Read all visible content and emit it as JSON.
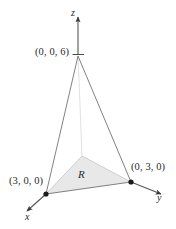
{
  "figure": {
    "kind": "3d-coordinate-sketch",
    "background_color": "#ffffff",
    "line_color": "#5a5a5a",
    "axis_color": "#3a3a3a",
    "text_color": "#2b2b2b",
    "region_fill_color": "#e8e8e8",
    "region_fill_opacity": 0.85,
    "vertex_dot_color": "#1a1a1a"
  },
  "axes": [
    {
      "id": "z",
      "label": "z",
      "direction": "up"
    },
    {
      "id": "x",
      "label": "x",
      "direction": "down-left"
    },
    {
      "id": "y",
      "label": "y",
      "direction": "down-right"
    }
  ],
  "vertices": [
    {
      "id": "apex",
      "label": "(0, 0, 6)",
      "point": [
        0,
        0,
        6
      ],
      "px": [
        78,
        55
      ],
      "dot": false
    },
    {
      "id": "xint",
      "label": "(3, 0, 0)",
      "point": [
        3,
        0,
        0
      ],
      "px": [
        46,
        194
      ],
      "dot": true
    },
    {
      "id": "yint",
      "label": "(0, 3, 0)",
      "point": [
        0,
        3,
        0
      ],
      "px": [
        131,
        182
      ],
      "dot": true
    },
    {
      "id": "origin",
      "label": "",
      "point": [
        0,
        0,
        0
      ],
      "px": [
        82,
        156
      ],
      "dot": false
    }
  ],
  "region": {
    "label": "R",
    "vertices": [
      "origin",
      "xint",
      "yint"
    ],
    "shaded": true
  },
  "edges": [
    {
      "from": "apex",
      "to": "xint",
      "style": "solid"
    },
    {
      "from": "apex",
      "to": "yint",
      "style": "solid"
    },
    {
      "from": "xint",
      "to": "yint",
      "style": "solid"
    },
    {
      "from": "apex",
      "to": "origin",
      "style": "faint"
    },
    {
      "from": "origin",
      "to": "xint",
      "style": "faint"
    },
    {
      "from": "origin",
      "to": "yint",
      "style": "faint"
    }
  ]
}
